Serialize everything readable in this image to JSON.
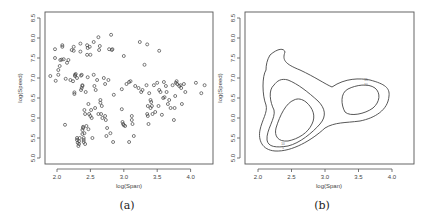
{
  "figure": {
    "panel_a_caption": "(a)",
    "panel_b_caption": "(b)"
  },
  "chart_data": [
    {
      "type": "scatter",
      "panel": "(a)",
      "title": "",
      "xlabel": "log(Span)",
      "ylabel": "log(Speed)",
      "xlim": [
        1.8,
        4.3
      ],
      "ylim": [
        4.9,
        8.6
      ],
      "xticks": [
        "2.0",
        "2.5",
        "3.0",
        "3.5",
        "4.0"
      ],
      "yticks": [
        "5.0",
        "5.5",
        "6.0",
        "6.5",
        "7.0",
        "7.5",
        "8.0",
        "8.5"
      ],
      "grid": false,
      "marker": "open-circle",
      "points": [
        [
          1.9,
          7.05
        ],
        [
          1.97,
          7.72
        ],
        [
          1.97,
          7.5
        ],
        [
          1.98,
          6.93
        ],
        [
          2.02,
          7.08
        ],
        [
          2.02,
          7.2
        ],
        [
          2.04,
          7.3
        ],
        [
          2.05,
          7.45
        ],
        [
          2.07,
          7.46
        ],
        [
          2.08,
          7.78
        ],
        [
          2.08,
          7.82
        ],
        [
          2.1,
          7.47
        ],
        [
          2.12,
          5.83
        ],
        [
          2.13,
          6.98
        ],
        [
          2.15,
          7.38
        ],
        [
          2.17,
          7.45
        ],
        [
          2.2,
          6.95
        ],
        [
          2.22,
          7.7
        ],
        [
          2.24,
          6.92
        ],
        [
          2.25,
          7.78
        ],
        [
          2.25,
          7.68
        ],
        [
          2.26,
          6.64
        ],
        [
          2.26,
          6.6
        ],
        [
          2.27,
          7.08
        ],
        [
          2.27,
          7.05
        ],
        [
          2.28,
          7.1
        ],
        [
          2.3,
          7.0
        ],
        [
          2.3,
          5.5
        ],
        [
          2.3,
          5.45
        ],
        [
          2.31,
          5.38
        ],
        [
          2.32,
          5.3
        ],
        [
          2.33,
          5.42
        ],
        [
          2.33,
          5.35
        ],
        [
          2.34,
          5.5
        ],
        [
          2.35,
          7.86
        ],
        [
          2.35,
          7.66
        ],
        [
          2.36,
          7.06
        ],
        [
          2.36,
          6.7
        ],
        [
          2.37,
          7.08
        ],
        [
          2.37,
          6.75
        ],
        [
          2.38,
          6.8
        ],
        [
          2.38,
          6.82
        ],
        [
          2.38,
          5.6
        ],
        [
          2.38,
          5.7
        ],
        [
          2.39,
          5.75
        ],
        [
          2.39,
          5.78
        ],
        [
          2.4,
          5.5
        ],
        [
          2.4,
          5.45
        ],
        [
          2.4,
          5.4
        ],
        [
          2.41,
          5.62
        ],
        [
          2.41,
          6.2
        ],
        [
          2.42,
          6.1
        ],
        [
          2.42,
          5.35
        ],
        [
          2.43,
          6.65
        ],
        [
          2.44,
          5.8
        ],
        [
          2.45,
          7.82
        ],
        [
          2.45,
          7.58
        ],
        [
          2.46,
          7.75
        ],
        [
          2.46,
          7.02
        ],
        [
          2.47,
          5.72
        ],
        [
          2.47,
          6.35
        ],
        [
          2.48,
          6.1
        ],
        [
          2.49,
          7.78
        ],
        [
          2.5,
          7.58
        ],
        [
          2.5,
          6.05
        ],
        [
          2.51,
          6.2
        ],
        [
          2.52,
          6.0
        ],
        [
          2.53,
          5.5
        ],
        [
          2.55,
          7.9
        ],
        [
          2.55,
          7.08
        ],
        [
          2.56,
          6.8
        ],
        [
          2.57,
          6.25
        ],
        [
          2.58,
          6.7
        ],
        [
          2.6,
          6.95
        ],
        [
          2.62,
          8.02
        ],
        [
          2.62,
          6.1
        ],
        [
          2.63,
          7.7
        ],
        [
          2.64,
          7.8
        ],
        [
          2.65,
          6.45
        ],
        [
          2.65,
          6.38
        ],
        [
          2.66,
          6.1
        ],
        [
          2.67,
          6.3
        ],
        [
          2.68,
          6.0
        ],
        [
          2.7,
          7.0
        ],
        [
          2.72,
          6.85
        ],
        [
          2.72,
          6.05
        ],
        [
          2.73,
          5.95
        ],
        [
          2.74,
          5.55
        ],
        [
          2.75,
          5.75
        ],
        [
          2.77,
          6.95
        ],
        [
          2.78,
          7.72
        ],
        [
          2.8,
          5.62
        ],
        [
          2.81,
          8.08
        ],
        [
          2.82,
          7.7
        ],
        [
          2.83,
          7.72
        ],
        [
          2.84,
          5.4
        ],
        [
          2.85,
          6.58
        ],
        [
          2.97,
          6.72
        ],
        [
          2.97,
          6.22
        ],
        [
          2.98,
          5.9
        ],
        [
          2.99,
          5.85
        ],
        [
          3.0,
          7.55
        ],
        [
          3.0,
          5.82
        ],
        [
          3.02,
          5.8
        ],
        [
          3.04,
          6.85
        ],
        [
          3.08,
          6.9
        ],
        [
          3.08,
          5.4
        ],
        [
          3.1,
          6.92
        ],
        [
          3.12,
          6.05
        ],
        [
          3.12,
          5.95
        ],
        [
          3.13,
          5.85
        ],
        [
          3.15,
          5.55
        ],
        [
          3.17,
          6.8
        ],
        [
          3.22,
          6.75
        ],
        [
          3.24,
          7.9
        ],
        [
          3.26,
          6.65
        ],
        [
          3.28,
          6.7
        ],
        [
          3.31,
          7.33
        ],
        [
          3.34,
          6.82
        ],
        [
          3.35,
          7.84
        ],
        [
          3.35,
          6.1
        ],
        [
          3.36,
          6.3
        ],
        [
          3.36,
          6.05
        ],
        [
          3.37,
          5.85
        ],
        [
          3.38,
          6.62
        ],
        [
          3.4,
          6.45
        ],
        [
          3.4,
          6.25
        ],
        [
          3.41,
          6.4
        ],
        [
          3.42,
          6.3
        ],
        [
          3.43,
          6.1
        ],
        [
          3.45,
          6.82
        ],
        [
          3.47,
          6.15
        ],
        [
          3.5,
          6.88
        ],
        [
          3.52,
          6.3
        ],
        [
          3.53,
          7.68
        ],
        [
          3.53,
          6.7
        ],
        [
          3.55,
          6.65
        ],
        [
          3.57,
          6.08
        ],
        [
          3.59,
          6.5
        ],
        [
          3.6,
          6.9
        ],
        [
          3.61,
          6.52
        ],
        [
          3.63,
          6.8
        ],
        [
          3.64,
          6.65
        ],
        [
          3.66,
          6.35
        ],
        [
          3.68,
          6.45
        ],
        [
          3.7,
          6.25
        ],
        [
          3.73,
          6.82
        ],
        [
          3.75,
          5.95
        ],
        [
          3.76,
          6.25
        ],
        [
          3.77,
          6.55
        ],
        [
          3.78,
          6.88
        ],
        [
          3.79,
          6.92
        ],
        [
          3.8,
          6.85
        ],
        [
          3.83,
          6.8
        ],
        [
          3.85,
          6.82
        ],
        [
          3.86,
          6.75
        ],
        [
          3.87,
          6.35
        ],
        [
          3.9,
          6.85
        ],
        [
          3.92,
          6.65
        ],
        [
          4.08,
          6.88
        ],
        [
          4.16,
          6.62
        ],
        [
          4.21,
          6.82
        ]
      ]
    },
    {
      "type": "contour",
      "panel": "(b)",
      "title": "",
      "xlabel": "log(Span)",
      "ylabel": "log(Speed)",
      "xlim": [
        1.8,
        4.3
      ],
      "ylim": [
        4.9,
        8.6
      ],
      "xticks": [
        "2.0",
        "2.5",
        "3.0",
        "3.5",
        "4.0"
      ],
      "yticks": [
        "5.0",
        "5.5",
        "6.0",
        "6.5",
        "7.0",
        "7.5",
        "8.0",
        "8.5"
      ],
      "grid": false,
      "levels": 3,
      "description": "2D kernel density contours; outer level spans both clusters (peak near log(Span)=2.4, log(Speed)=7.7 extends left arm); inner modes near (2.55, 5.95) and (3.55, 6.5)"
    }
  ]
}
